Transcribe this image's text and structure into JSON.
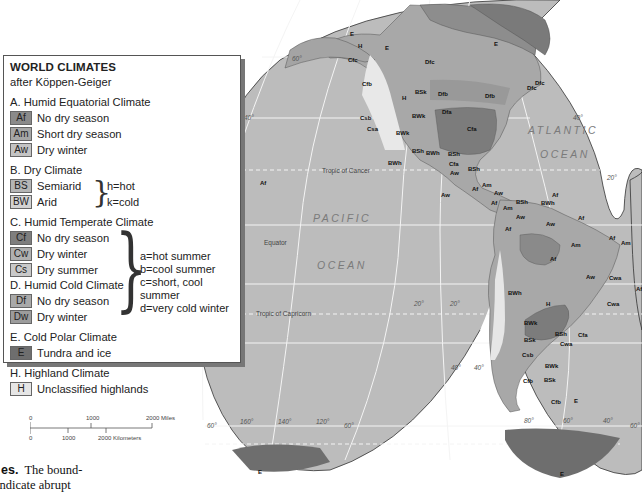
{
  "legend": {
    "title": "WORLD CLIMATES",
    "subtitle": "after Köppen-Geiger",
    "sections": [
      {
        "heading": "A. Humid Equatorial Climate",
        "items": [
          {
            "code": "Af",
            "label": "No dry season",
            "color": "#8a8a8a"
          },
          {
            "code": "Am",
            "label": "Short dry season",
            "color": "#a6a6a6"
          },
          {
            "code": "Aw",
            "label": "Dry winter",
            "color": "#c4c4c4"
          }
        ]
      },
      {
        "heading": "B. Dry Climate",
        "items": [
          {
            "code": "BS",
            "label": "Semiarid",
            "color": "#b5b5b5"
          },
          {
            "code": "BW",
            "label": "Arid",
            "color": "#d2d2d2"
          }
        ],
        "notes": [
          "h=hot",
          "k=cold"
        ]
      },
      {
        "heading": "C. Humid Temperate Climate",
        "items": [
          {
            "code": "Cf",
            "label": "No dry season",
            "color": "#7e7e7e"
          },
          {
            "code": "Cw",
            "label": "Dry winter",
            "color": "#b0b0b0"
          },
          {
            "code": "Cs",
            "label": "Dry summer",
            "color": "#c9c9c9"
          }
        ]
      },
      {
        "heading": "D. Humid Cold Climate",
        "items": [
          {
            "code": "Df",
            "label": "No dry season",
            "color": "#a9a9a9"
          },
          {
            "code": "Dw",
            "label": "Dry winter",
            "color": "#9c9c9c"
          }
        ],
        "notes": [
          "a=hot summer",
          "b=cool summer",
          "c=short, cool summer",
          "d=very cold winter"
        ]
      },
      {
        "heading": "E. Cold Polar Climate",
        "items": [
          {
            "code": "E",
            "label": "Tundra and ice",
            "color": "#6e6e6e"
          }
        ]
      },
      {
        "heading": "H. Highland Climate",
        "items": [
          {
            "code": "H",
            "label": "Unclassified highlands",
            "color": "#e6e6e6"
          }
        ]
      }
    ]
  },
  "scale_bar": {
    "miles": [
      "0",
      "1000",
      "2000 Miles"
    ],
    "kilometers": [
      "0",
      "1000",
      "2000 Kilometers"
    ]
  },
  "caption": {
    "bold": "es.",
    "line1": "The bound-",
    "line2": "indicate abrupt"
  },
  "map": {
    "oceans": [
      "ATLANTIC",
      "OCEAN",
      "PACIFIC",
      "OCEAN"
    ],
    "reference_lines": [
      "Tropic of Cancer",
      "Equator",
      "Tropic of Capricorn"
    ],
    "grid_labels": [
      "60°",
      "40°",
      "40°",
      "20°",
      "20°",
      "20°",
      "20°",
      "40°",
      "40°",
      "60°",
      "160°",
      "140°",
      "120°",
      "60°",
      "80°",
      "60°",
      "40°",
      "60°"
    ],
    "climate_labels": [
      "E",
      "E",
      "E",
      "H",
      "Dfc",
      "Cfc",
      "Dfc",
      "Cfb",
      "BSk",
      "Dfb",
      "Dfb",
      "Dfc",
      "H",
      "BWk",
      "Dfa",
      "Cfa",
      "Csb",
      "Csa",
      "BWk",
      "BSh",
      "BWh",
      "BWh",
      "BSh",
      "Cfa",
      "BSh",
      "Aw",
      "Am",
      "Af",
      "Aw",
      "Aw",
      "Af",
      "Am",
      "BSh",
      "BWh",
      "Af",
      "Aw",
      "Af",
      "Aw",
      "Am",
      "Af",
      "Af",
      "Am",
      "Aw",
      "Cwa",
      "Af",
      "Cwa",
      "BWh",
      "H",
      "Af",
      "BWk",
      "BSh",
      "Cfa",
      "Cwa",
      "BSk",
      "Csb",
      "BWk",
      "Cfb",
      "BSk",
      "Cfb",
      "E",
      "E",
      "E",
      "Af"
    ]
  },
  "colors": {
    "ocean": "#b9b9b9",
    "land_base": "#a8a8a8",
    "grid": "#f2f2f2",
    "legend_border": "#555555"
  }
}
